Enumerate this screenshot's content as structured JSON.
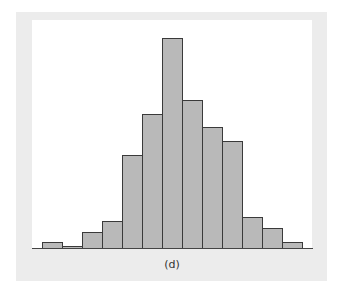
{
  "chart_data": {
    "type": "bar",
    "subtype": "histogram",
    "title": "",
    "caption": "(d)",
    "xlabel": "",
    "ylabel": "",
    "grid": false,
    "legend": null,
    "categories": [
      "1",
      "2",
      "3",
      "4",
      "5",
      "6",
      "7",
      "8",
      "9",
      "10",
      "11",
      "12",
      "13"
    ],
    "values": [
      7,
      3,
      17,
      28,
      94,
      135,
      211,
      149,
      122,
      108,
      32,
      21,
      7
    ],
    "value_units": "relative height (px at baseline scale)",
    "ylim": [
      0,
      229
    ],
    "colors": {
      "bar_fill": "#b9b9b9",
      "bar_edge": "#3a3a3a",
      "frame": "#ececec",
      "plot_bg": "#ffffff"
    }
  },
  "figure": {
    "caption": "(d)"
  }
}
